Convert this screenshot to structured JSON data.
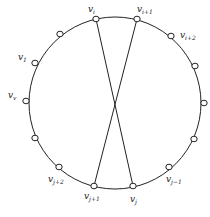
{
  "diagram": {
    "type": "cycle-with-crossing-edges",
    "circle": {
      "cx": 115,
      "cy": 103,
      "r": 86,
      "stroke": "#222222"
    },
    "nodes": [
      {
        "id": "vi",
        "x": 96,
        "y": 19,
        "label": "v",
        "sub": "i",
        "lx": 88,
        "ly": 12
      },
      {
        "id": "vi1",
        "x": 137,
        "y": 19,
        "label": "v",
        "sub": "i+1",
        "lx": 137,
        "ly": 12
      },
      {
        "id": "vi2",
        "x": 171,
        "y": 36,
        "label": "v",
        "sub": "i+2",
        "lx": 180,
        "ly": 38
      },
      {
        "id": "n4",
        "x": 195,
        "y": 66,
        "label": "",
        "sub": ""
      },
      {
        "id": "n5",
        "x": 204,
        "y": 103,
        "label": "",
        "sub": ""
      },
      {
        "id": "n6",
        "x": 194,
        "y": 139,
        "label": "",
        "sub": ""
      },
      {
        "id": "vj-1",
        "x": 169,
        "y": 167,
        "label": "v",
        "sub": "j−1",
        "lx": 166,
        "ly": 182
      },
      {
        "id": "vj",
        "x": 133,
        "y": 186,
        "label": "v",
        "sub": "j",
        "lx": 130,
        "ly": 202
      },
      {
        "id": "vj1",
        "x": 94,
        "y": 186,
        "label": "v",
        "sub": "j+1",
        "lx": 84,
        "ly": 199
      },
      {
        "id": "vj2",
        "x": 59,
        "y": 167,
        "label": "v",
        "sub": "j+2",
        "lx": 48,
        "ly": 182
      },
      {
        "id": "n11",
        "x": 35,
        "y": 138,
        "label": "",
        "sub": ""
      },
      {
        "id": "vv",
        "x": 26,
        "y": 101,
        "label": "v",
        "sub": "v",
        "lx": 8,
        "ly": 98
      },
      {
        "id": "v1",
        "x": 35,
        "y": 63,
        "label": "v",
        "sub": "1",
        "lx": 18,
        "ly": 60
      },
      {
        "id": "n14",
        "x": 60,
        "y": 34,
        "label": "",
        "sub": ""
      }
    ],
    "edges": [
      {
        "from": "vi",
        "to": "vj"
      },
      {
        "from": "vi1",
        "to": "vj1"
      }
    ]
  }
}
